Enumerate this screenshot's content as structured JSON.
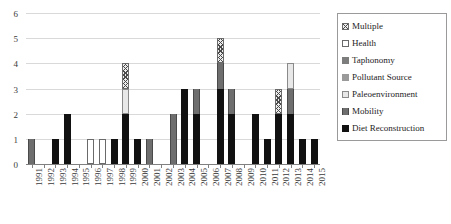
{
  "chart_data": {
    "type": "bar",
    "title": "",
    "xlabel": "",
    "ylabel": "",
    "ylim": [
      0,
      6
    ],
    "yticks": [
      0,
      1,
      2,
      3,
      4,
      5,
      6
    ],
    "grid": true,
    "stacked": true,
    "legend_position": "right",
    "categories": [
      "1991",
      "1992",
      "1993",
      "1994",
      "1995",
      "1996",
      "1997",
      "1998",
      "1999",
      "2000",
      "2001",
      "2002",
      "2003",
      "2004",
      "2005",
      "2006",
      "2007",
      "2008",
      "2009",
      "2010",
      "2011",
      "2012",
      "2013",
      "2014",
      "2015"
    ],
    "series": [
      {
        "name": "Diet Reconstruction",
        "values": [
          0,
          0,
          1,
          2,
          0,
          0,
          0,
          1,
          2,
          1,
          0,
          0,
          0,
          3,
          2,
          0,
          3,
          2,
          0,
          2,
          1,
          2,
          2,
          1,
          1
        ]
      },
      {
        "name": "Mobility",
        "values": [
          1,
          0,
          0,
          0,
          0,
          0,
          0,
          0,
          0,
          0,
          1,
          0,
          2,
          0,
          1,
          0,
          1,
          1,
          0,
          0,
          0,
          0,
          1,
          0,
          0
        ]
      },
      {
        "name": "Paleoenvironment",
        "values": [
          0,
          0,
          0,
          0,
          0,
          0,
          0,
          0,
          1,
          0,
          0,
          0,
          0,
          0,
          0,
          0,
          0,
          0,
          0,
          0,
          0,
          0,
          1,
          0,
          0
        ]
      },
      {
        "name": "Pollutant Source",
        "values": [
          0,
          0,
          0,
          0,
          0,
          0,
          0,
          0,
          0,
          0,
          0,
          0,
          0,
          0,
          0,
          0,
          0,
          0,
          0,
          0,
          0,
          0,
          0,
          0,
          0
        ]
      },
      {
        "name": "Taphonomy",
        "values": [
          0,
          0,
          0,
          0,
          0,
          0,
          0,
          0,
          0,
          0,
          0,
          0,
          0,
          0,
          0,
          0,
          0,
          0,
          0,
          0,
          0,
          0,
          0,
          0,
          0
        ]
      },
      {
        "name": "Health",
        "values": [
          0,
          0,
          0,
          0,
          0,
          1,
          1,
          0,
          0,
          0,
          0,
          0,
          0,
          0,
          0,
          0,
          0,
          0,
          0,
          0,
          0,
          0,
          0,
          0,
          0
        ]
      },
      {
        "name": "Multiple",
        "values": [
          0,
          0,
          0,
          0,
          0,
          0,
          0,
          0,
          1,
          0,
          0,
          0,
          0,
          0,
          0,
          0,
          1,
          0,
          0,
          0,
          0,
          1,
          0,
          0,
          0
        ]
      }
    ],
    "totals": [
      1,
      0,
      1,
      2,
      0,
      1,
      1,
      1,
      4,
      1,
      1,
      0,
      2,
      3,
      3,
      0,
      5,
      3,
      0,
      2,
      1,
      3,
      4,
      1,
      1
    ]
  },
  "legend": {
    "items": [
      {
        "label": "Multiple",
        "pattern": "pat-multiple"
      },
      {
        "label": "Health",
        "pattern": "pat-health"
      },
      {
        "label": "Taphonomy",
        "pattern": "pat-taphonomy"
      },
      {
        "label": "Pollutant Source",
        "pattern": "pat-pollutant"
      },
      {
        "label": "Paleoenvironment",
        "pattern": "pat-paleo"
      },
      {
        "label": "Mobility",
        "pattern": "pat-mobility"
      },
      {
        "label": "Diet Reconstruction",
        "pattern": "pat-diet"
      }
    ]
  },
  "colors": {
    "diet": "#111111",
    "mobility": "#6e6e6e",
    "paleoenvironment": "#e8e8e8",
    "pollutant_source": "#9a9a9a",
    "taphonomy": "#7d7d7d",
    "health": "#ffffff",
    "multiple": "#ededed",
    "gridline": "#d9d9d9",
    "axis": "#808080",
    "text": "#3a3a3a"
  }
}
